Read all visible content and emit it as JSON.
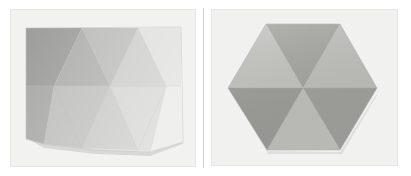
{
  "figure": {
    "background_color": "#ffffff",
    "width": 411,
    "height": 176,
    "panel_divider_color": "#cfcfcf"
  },
  "panels": [
    {
      "id": "panel-left",
      "name": "folded-sheet-oblique-view",
      "caption": "Rectangular folded sheet with triangular creases, bowed lower edge",
      "photo_background_color": "#f2f2f0",
      "photo_border_color": "#e4e4e2",
      "shape": {
        "type": "folded-rectangle",
        "facet_count": 12,
        "outline_points": "26,28 181,27 183,142 150,152 95,150 44,144 26,139",
        "fold_line_color": "#b8b8b6",
        "facets": [
          {
            "name": "facet-top-1",
            "points": "26,28 82,28 54,86 26,86",
            "fill": "#9d9d9b"
          },
          {
            "name": "facet-top-2",
            "points": "82,28 54,86 110,86",
            "fill": "#adadab"
          },
          {
            "name": "facet-top-3",
            "points": "82,28 138,28 110,86",
            "fill": "#b9b9b7"
          },
          {
            "name": "facet-top-4",
            "points": "138,28 110,86 166,86",
            "fill": "#c9c9c7"
          },
          {
            "name": "facet-top-5",
            "points": "138,28 181,27 181,86 166,86",
            "fill": "#dcdcda"
          },
          {
            "name": "facet-mid-left",
            "points": "26,86 54,86 26,139",
            "fill": "#a3a3a1"
          },
          {
            "name": "facet-bottom-1",
            "points": "26,86 54,86 44,144 26,139",
            "fill": "#a8a8a6"
          },
          {
            "name": "facet-bottom-2",
            "points": "54,86 110,86 82,148 44,144",
            "fill": "#bdbdbb"
          },
          {
            "name": "facet-bottom-3",
            "points": "82,148 110,86 138,150",
            "fill": "#c6c6c4"
          },
          {
            "name": "facet-bottom-4",
            "points": "110,86 166,86 150,152 138,150",
            "fill": "#d2d2d0"
          },
          {
            "name": "facet-bottom-5",
            "points": "166,86 181,86 183,142 150,152",
            "fill": "#e6e6e4"
          },
          {
            "name": "facet-top-right-corner",
            "points": "166,86 181,86 181,27",
            "fill": "#e2e2e0"
          }
        ]
      }
    },
    {
      "id": "panel-right",
      "name": "folded-hexagon-frontal-view",
      "caption": "Hexagonal folded form, six triangular facets meeting at the centre",
      "photo_background_color": "#f1f1ef",
      "photo_border_color": "#e4e4e2",
      "shape": {
        "type": "hexagon-six-triangles",
        "facet_count": 6,
        "center": "303,88",
        "vertices": "266,24 340,24 377,88 340,150 267,150 228,88",
        "fold_line_color": "#b0b0ae",
        "facets": [
          {
            "name": "facet-upper-left",
            "points": "228,88 266,24 303,88",
            "fill": "#c4c4c0"
          },
          {
            "name": "facet-upper-centre",
            "points": "266,24 340,24 303,88",
            "fill": "#a5a5a1"
          },
          {
            "name": "facet-upper-right",
            "points": "340,24 377,88 303,88",
            "fill": "#c0c0bc"
          },
          {
            "name": "facet-lower-right",
            "points": "377,88 340,150 303,88",
            "fill": "#a2a29e"
          },
          {
            "name": "facet-lower-centre",
            "points": "340,150 267,150 303,88",
            "fill": "#c2c2be"
          },
          {
            "name": "facet-lower-left",
            "points": "267,150 228,88 303,88",
            "fill": "#9e9e9a"
          }
        ]
      }
    }
  ]
}
